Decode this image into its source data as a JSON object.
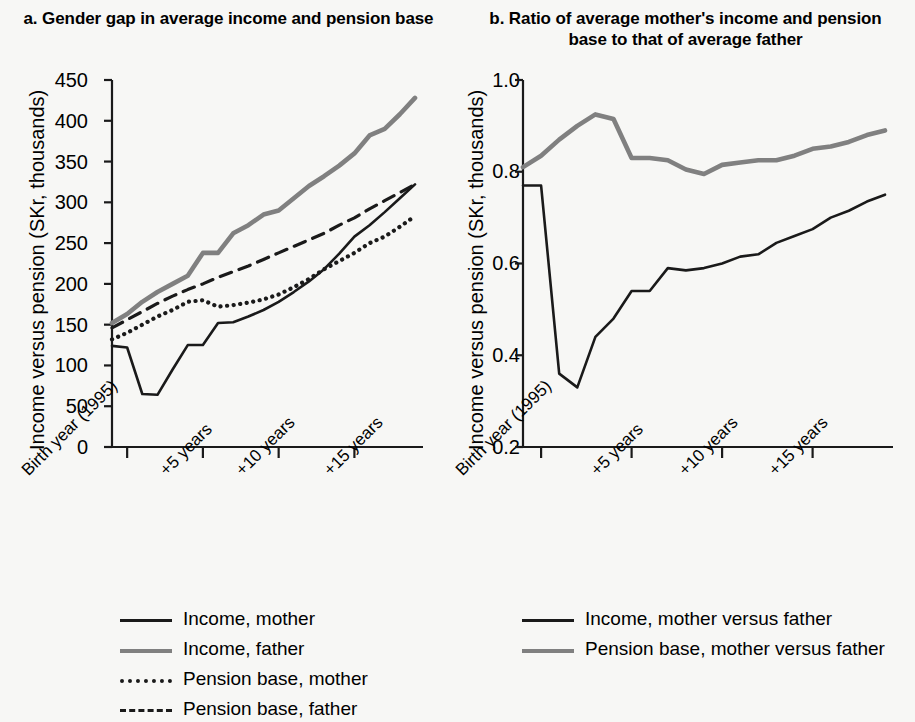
{
  "panel_a": {
    "title": "a. Gender gap in average income and pension base",
    "ylabel": "Income versus pension (SKr, thousands)",
    "yticks": [
      "0",
      "50",
      "100",
      "150",
      "200",
      "250",
      "300",
      "350",
      "400",
      "450"
    ],
    "xticks": [
      "Birth year (1995)",
      "+5 years",
      "+10 years",
      "+15 years"
    ],
    "legend": [
      {
        "label": "Income, mother",
        "style": "solid-black",
        "color": "#1a1a1a"
      },
      {
        "label": "Income, father",
        "style": "solid-grey",
        "color": "#808080"
      },
      {
        "label": "Pension base, mother",
        "style": "dotted",
        "color": "#1a1a1a"
      },
      {
        "label": "Pension base, father",
        "style": "dashed",
        "color": "#1a1a1a"
      }
    ]
  },
  "panel_b": {
    "title": "b. Ratio of average mother's income and pension base to that of average father",
    "ylabel": "Income versus pension (SKr, thousands)",
    "yticks": [
      "0.2",
      "0.4",
      "0.6",
      "0.8",
      "1.0"
    ],
    "xticks": [
      "Birth year (1995)",
      "+5 years",
      "+10 years",
      "+15 years"
    ],
    "legend": [
      {
        "label": "Income, mother versus father",
        "style": "solid-black",
        "color": "#1a1a1a"
      },
      {
        "label": "Pension base, mother versus father",
        "style": "solid-grey",
        "color": "#808080"
      }
    ]
  },
  "chart_data": [
    {
      "type": "line",
      "id": "panel-a",
      "title": "a. Gender gap in average income and pension base",
      "xlabel": "",
      "ylabel": "Income versus pension (SKr, thousands)",
      "ylim": [
        0,
        450
      ],
      "ytick_values": [
        0,
        50,
        100,
        150,
        200,
        250,
        300,
        350,
        400,
        450
      ],
      "grid": false,
      "legend_position": "below",
      "x": [
        0,
        1,
        2,
        3,
        4,
        5,
        6,
        7,
        8,
        9,
        10,
        11,
        12,
        13,
        14,
        15,
        16,
        17,
        18,
        19,
        20
      ],
      "x_tick_positions": [
        1,
        6,
        11,
        16
      ],
      "x_tick_labels": [
        "Birth year (1995)",
        "+5 years",
        "+10 years",
        "+15 years"
      ],
      "series": [
        {
          "name": "Income, mother",
          "style": "solid",
          "color": "#1a1a1a",
          "values": [
            124,
            122,
            65,
            64,
            95,
            125,
            125,
            152,
            153,
            160,
            168,
            178,
            190,
            203,
            218,
            237,
            258,
            272,
            288,
            305,
            322
          ]
        },
        {
          "name": "Income, father",
          "style": "solid",
          "color": "#808080",
          "values": [
            152,
            163,
            178,
            190,
            200,
            210,
            238,
            238,
            262,
            272,
            285,
            290,
            305,
            320,
            332,
            345,
            360,
            382,
            390,
            408,
            428
          ]
        },
        {
          "name": "Pension base, mother",
          "style": "dotted",
          "color": "#1a1a1a",
          "values": [
            132,
            140,
            150,
            160,
            168,
            178,
            180,
            172,
            174,
            177,
            181,
            187,
            196,
            206,
            218,
            228,
            238,
            250,
            258,
            270,
            283
          ]
        },
        {
          "name": "Pension base, father",
          "style": "dashed",
          "color": "#1a1a1a",
          "values": [
            146,
            156,
            166,
            176,
            185,
            193,
            200,
            208,
            215,
            222,
            230,
            238,
            246,
            254,
            262,
            272,
            281,
            292,
            302,
            312,
            322
          ]
        }
      ]
    },
    {
      "type": "line",
      "id": "panel-b",
      "title": "b. Ratio of average mother's income and pension base to that of average father",
      "xlabel": "",
      "ylabel": "Income versus pension (SKr, thousands)",
      "ylim": [
        0.2,
        1.0
      ],
      "ytick_values": [
        0.2,
        0.4,
        0.6,
        0.8,
        1.0
      ],
      "grid": false,
      "legend_position": "below",
      "x": [
        0,
        1,
        2,
        3,
        4,
        5,
        6,
        7,
        8,
        9,
        10,
        11,
        12,
        13,
        14,
        15,
        16,
        17,
        18,
        19,
        20
      ],
      "x_tick_positions": [
        1,
        6,
        11,
        16
      ],
      "x_tick_labels": [
        "Birth year (1995)",
        "+5 years",
        "+10 years",
        "+15 years"
      ],
      "series": [
        {
          "name": "Income, mother versus father",
          "style": "solid",
          "color": "#1a1a1a",
          "values": [
            0.77,
            0.77,
            0.36,
            0.33,
            0.44,
            0.48,
            0.54,
            0.54,
            0.59,
            0.585,
            0.59,
            0.6,
            0.615,
            0.62,
            0.645,
            0.66,
            0.675,
            0.7,
            0.715,
            0.735,
            0.75
          ]
        },
        {
          "name": "Pension base, mother versus father",
          "style": "solid",
          "color": "#808080",
          "values": [
            0.81,
            0.835,
            0.87,
            0.9,
            0.925,
            0.915,
            0.83,
            0.83,
            0.825,
            0.805,
            0.795,
            0.815,
            0.82,
            0.825,
            0.825,
            0.835,
            0.85,
            0.855,
            0.865,
            0.88,
            0.89
          ]
        }
      ]
    }
  ]
}
